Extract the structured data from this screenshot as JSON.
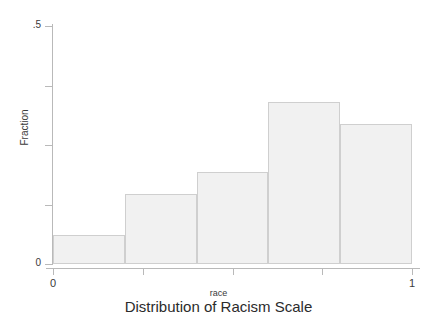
{
  "chart_data": {
    "type": "bar",
    "title": "Distribution of Racism Scale",
    "xlabel": "race",
    "ylabel": "Fraction",
    "categories": [
      "0–.2",
      ".2–.4",
      ".4–.6",
      ".6–.8",
      ".8–1"
    ],
    "bin_edges": [
      0,
      0.2,
      0.4,
      0.6,
      0.8,
      1
    ],
    "values": [
      0.061,
      0.147,
      0.193,
      0.34,
      0.294
    ],
    "xlim": [
      0,
      1
    ],
    "ylim": [
      0,
      0.5
    ],
    "x_ticks": [
      0,
      0.25,
      0.5,
      0.75,
      1
    ],
    "x_tick_labels": [
      "0",
      "",
      "",
      "",
      "1"
    ],
    "y_ticks": [
      0,
      0.125,
      0.25,
      0.375,
      0.5
    ],
    "y_tick_labels": [
      "0",
      "",
      "",
      "",
      ".5"
    ],
    "grid": false,
    "legend": false,
    "bar_fill_color": "#f1f1f1",
    "bar_edge_color": "#cfcfcf",
    "axis_color": "#b9b9b9",
    "text_color": "#3a3a3a"
  }
}
